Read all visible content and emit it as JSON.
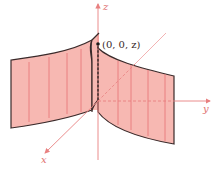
{
  "figure": {
    "axes": {
      "x_label": "x",
      "y_label": "y",
      "z_label": "z"
    },
    "point_label": "(0, 0, z)",
    "colors": {
      "surface_fill": "#f7b8b2",
      "rulings": "#e8787a",
      "axes": "#e88080",
      "outline": "#3a2a2a",
      "point": "#1a1a1a"
    }
  }
}
